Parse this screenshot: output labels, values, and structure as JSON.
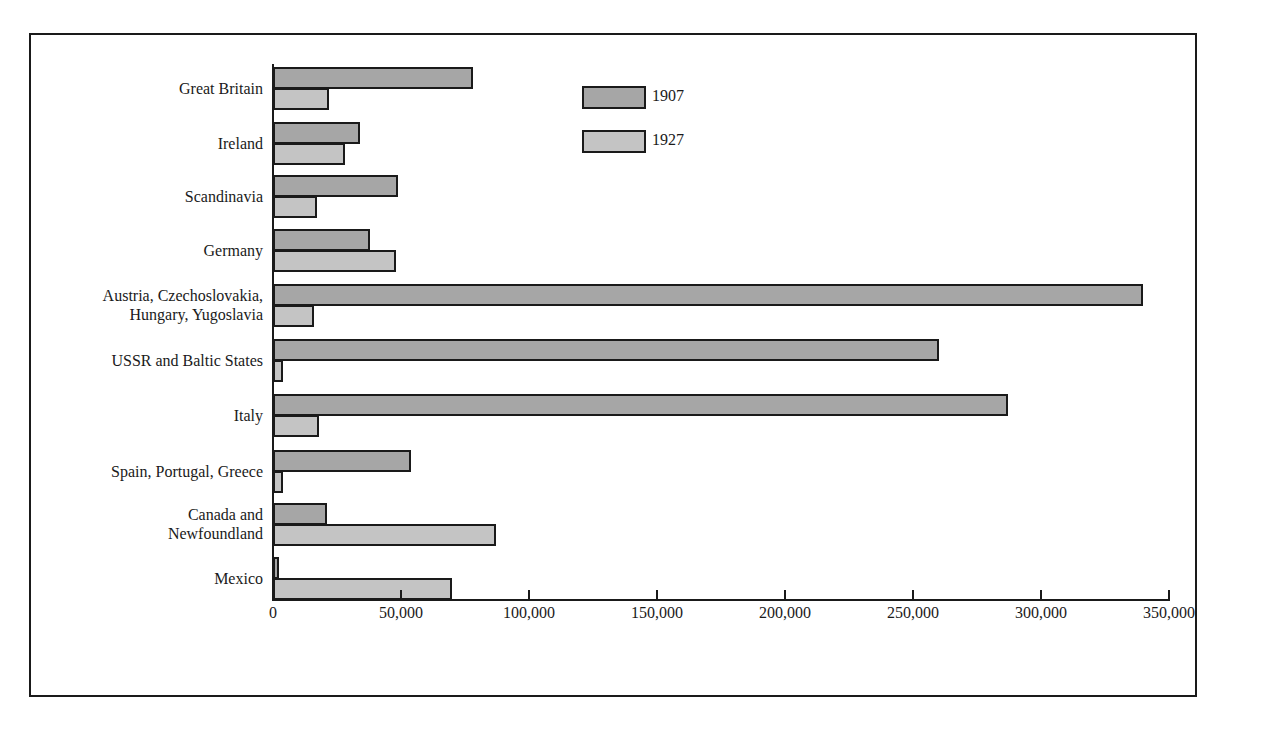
{
  "chart_data": {
    "type": "bar",
    "orientation": "horizontal",
    "title": "",
    "xlabel": "",
    "ylabel": "",
    "xlim": [
      0,
      350000
    ],
    "grid": false,
    "legend_position": "top-center",
    "categories": [
      "Great Britain",
      "Ireland",
      "Scandinavia",
      "Germany",
      "Austria, Czechoslovakia, Hungary, Yugoslavia",
      "USSR and Baltic States",
      "Italy",
      "Spain, Portugal, Greece",
      "Canada and Newfoundland",
      "Mexico"
    ],
    "series": [
      {
        "name": "1907",
        "color": "#a6a6a6",
        "values": [
          78000,
          34000,
          49000,
          38000,
          340000,
          260000,
          287000,
          54000,
          21000,
          2000
        ]
      },
      {
        "name": "1927",
        "color": "#c4c4c4",
        "values": [
          22000,
          28000,
          17000,
          48000,
          16000,
          4000,
          18000,
          4000,
          87000,
          70000
        ]
      }
    ],
    "x_ticks": [
      "0",
      "50,000",
      "100,000",
      "150,000",
      "200,000",
      "250,000",
      "300,000",
      "350,000"
    ]
  },
  "labels": {
    "cat0": [
      "Great Britain"
    ],
    "cat1": [
      "Ireland"
    ],
    "cat2": [
      "Scandinavia"
    ],
    "cat3": [
      "Germany"
    ],
    "cat4": [
      "Austria, Czechoslovakia,",
      "Hungary, Yugoslavia"
    ],
    "cat5": [
      "USSR and Baltic States"
    ],
    "cat6": [
      "Italy"
    ],
    "cat7": [
      "Spain, Portugal, Greece"
    ],
    "cat8": [
      "Canada and",
      "Newfoundland"
    ],
    "cat9": [
      "Mexico"
    ]
  },
  "legend": {
    "s1907": "1907",
    "s1927": "1927"
  }
}
